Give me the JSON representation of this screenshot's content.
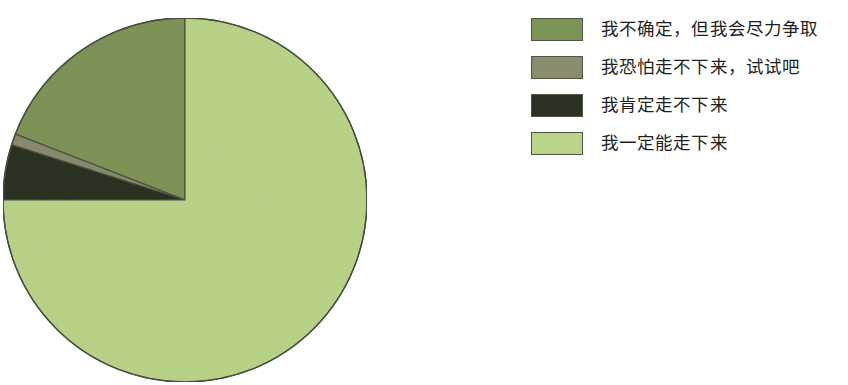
{
  "chart_data": {
    "type": "pie",
    "title": "",
    "subtitle": "",
    "xlabel": "",
    "ylabel": "",
    "grid": false,
    "legend_position": "right",
    "start_angle_deg": 90,
    "direction": "counterclockwise",
    "labels": [
      "我不确定，但我会尽力争取",
      "我恐怕走不下来，试试吧",
      "我肯定走不下来",
      "我一定能走下来"
    ],
    "values": [
      19.1,
      1.0,
      4.9,
      75.0
    ],
    "slice_angles_deg": [
      68.8,
      3.6,
      17.6,
      270.0
    ],
    "colors": [
      "#7d9457",
      "#8b8c6e",
      "#2b3123",
      "#b9d488"
    ],
    "slice_border_color": "#4a5140",
    "background": "#ffffff"
  },
  "legend": {
    "items": [
      {
        "label": "我不确定，但我会尽力争取",
        "color": "#7d9457"
      },
      {
        "label": "我恐怕走不下来，试试吧",
        "color": "#8b8c6e"
      },
      {
        "label": "我肯定走不下来",
        "color": "#2b3123"
      },
      {
        "label": "我一定能走下来",
        "color": "#b9d488"
      }
    ]
  }
}
